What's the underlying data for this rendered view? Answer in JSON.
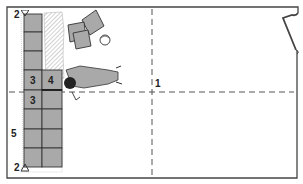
{
  "diagram": {
    "title": "",
    "type": "floor-tiling-layout",
    "colors": {
      "tile": "#a9a9a9",
      "tile_line": "#333333",
      "wall": "#444444",
      "guide_line": "#555555",
      "adhesive_hatch": "#888888"
    },
    "labels": {
      "top_marker": "2",
      "bottom_marker": "2",
      "center_mark": "1",
      "tile_3a": "3",
      "tile_3b": "3",
      "tile_4": "4",
      "row_label": "5"
    },
    "elements": [
      "room-outline",
      "door-opening",
      "vertical-center-guideline",
      "horizontal-center-guideline",
      "tile-column",
      "adhesive-hatched-area",
      "loose-tile-stack",
      "bucket",
      "kneeling-worker"
    ]
  }
}
